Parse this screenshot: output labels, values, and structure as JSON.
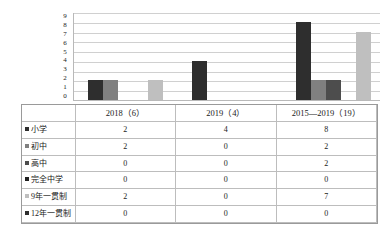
{
  "chart_data": {
    "type": "bar",
    "title": "",
    "xlabel": "",
    "ylabel": "",
    "ylim": [
      0,
      9
    ],
    "grid": true,
    "legend_position": "left-table",
    "categories": [
      "2018（6）",
      "2019（4）",
      "2015—2019（19）"
    ],
    "yticks": [
      "9",
      "8",
      "7",
      "6",
      "5",
      "4",
      "3",
      "2",
      "1",
      "0"
    ],
    "series": [
      {
        "name": "小学",
        "color": "#2e2e2e",
        "values": [
          2,
          4,
          8
        ]
      },
      {
        "name": "初中",
        "color": "#808080",
        "values": [
          2,
          0,
          2
        ]
      },
      {
        "name": "高中",
        "color": "#4d4d4d",
        "values": [
          0,
          0,
          2
        ]
      },
      {
        "name": "完全中学",
        "color": "#1f1f1f",
        "values": [
          0,
          0,
          0
        ]
      },
      {
        "name": "9年一贯制",
        "color": "#bfbfbf",
        "values": [
          2,
          0,
          7
        ]
      },
      {
        "name": "12年一贯制",
        "color": "#2e2e2e",
        "values": [
          0,
          0,
          0
        ]
      }
    ]
  },
  "table": {
    "corner_label": "",
    "column_headers": [
      "2018（6）",
      "2019（4）",
      "2015—2019（19）"
    ],
    "rows": [
      {
        "label": "小学",
        "marker_color": "#2e2e2e",
        "values": [
          "2",
          "4",
          "8"
        ]
      },
      {
        "label": "初中",
        "marker_color": "#808080",
        "values": [
          "2",
          "0",
          "2"
        ]
      },
      {
        "label": "高中",
        "marker_color": "#4d4d4d",
        "values": [
          "0",
          "0",
          "2"
        ]
      },
      {
        "label": "完全中学",
        "marker_color": "#1f1f1f",
        "values": [
          "0",
          "0",
          "0"
        ]
      },
      {
        "label": "9年一贯制",
        "marker_color": "#bfbfbf",
        "values": [
          "2",
          "0",
          "7"
        ]
      },
      {
        "label": "12年一贯制",
        "marker_color": "#2e2e2e",
        "values": [
          "0",
          "0",
          "0"
        ]
      }
    ]
  }
}
